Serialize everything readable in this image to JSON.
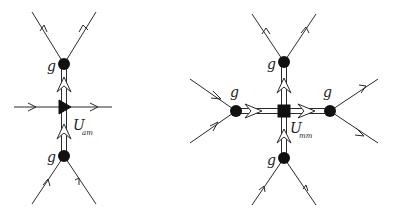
{
  "diagrams": [
    {
      "id": "left",
      "description": "Vertex with triangle node connecting two g vertices vertically, horizontal through-line",
      "labels": {
        "top_node": "g",
        "bottom_node": "g",
        "propagator": "U",
        "propagator_sub": "am"
      },
      "central_node_shape": "triangle"
    },
    {
      "id": "right",
      "description": "Vertex with square node connecting four g vertices",
      "labels": {
        "top_node": "g",
        "bottom_node": "g",
        "left_node": "g",
        "right_node": "g",
        "propagator": "U",
        "propagator_sub": "mm"
      },
      "central_node_shape": "square"
    }
  ],
  "colors": {
    "line": "#2a2a2a",
    "node": "#111111",
    "background": "#ffffff"
  }
}
